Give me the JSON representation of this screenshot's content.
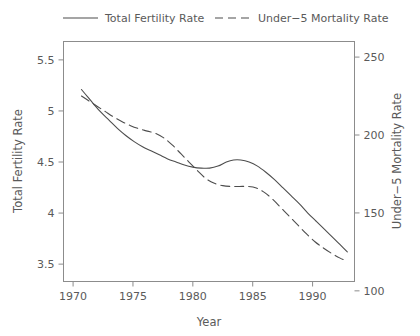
{
  "chart_data": {
    "type": "line",
    "title": "",
    "subtitle": "",
    "xlabel": "Year",
    "ylabel": "Total Fertility Rate",
    "y2label": "Under−5 Mortality Rate",
    "xlim": [
      1969.2,
      1993.5
    ],
    "ylim": [
      3.33,
      5.68
    ],
    "y2lim": [
      106,
      260
    ],
    "xticks": [
      1970,
      1975,
      1980,
      1985,
      1990
    ],
    "xticklabels": [
      "1970",
      "1975",
      "1980",
      "1985",
      "1990"
    ],
    "yticks": [
      3.5,
      4,
      4.5,
      5,
      5.5
    ],
    "yticklabels": [
      "3.5",
      "4",
      "4.5",
      "5",
      "5.5"
    ],
    "y2ticks": [
      100,
      150,
      200,
      250
    ],
    "y2ticklabels": [
      "100",
      "150",
      "200",
      "250"
    ],
    "grid": false,
    "legend_position": "top",
    "line_color": "#4d4d4d",
    "axis_color": "#808080",
    "series": [
      {
        "name": "Total Fertility Rate",
        "axis": "left",
        "style": "solid",
        "x": [
          1970.7,
          1971.2,
          1971.7,
          1972.3,
          1973.0,
          1973.7,
          1974.4,
          1975.1,
          1975.8,
          1976.5,
          1977.2,
          1977.9,
          1978.6,
          1979.3,
          1980.0,
          1980.7,
          1981.4,
          1982.1,
          1982.8,
          1983.4,
          1984.0,
          1984.7,
          1985.4,
          1986.1,
          1986.8,
          1987.5,
          1988.2,
          1988.9,
          1989.6,
          1990.3,
          1991.0,
          1991.7,
          1992.3,
          1992.9
        ],
        "y": [
          5.21,
          5.14,
          5.07,
          4.99,
          4.91,
          4.83,
          4.76,
          4.7,
          4.65,
          4.61,
          4.57,
          4.53,
          4.5,
          4.47,
          4.45,
          4.44,
          4.44,
          4.46,
          4.5,
          4.52,
          4.52,
          4.5,
          4.46,
          4.4,
          4.33,
          4.25,
          4.17,
          4.09,
          4.0,
          3.92,
          3.84,
          3.76,
          3.69,
          3.62
        ]
      },
      {
        "name": "Under−5 Mortality Rate",
        "axis": "right",
        "style": "dashed",
        "x": [
          1970.7,
          1971.3,
          1972.0,
          1972.7,
          1973.4,
          1974.1,
          1974.8,
          1975.5,
          1976.2,
          1976.9,
          1977.6,
          1978.3,
          1979.0,
          1979.7,
          1980.4,
          1981.1,
          1981.8,
          1982.5,
          1983.2,
          1983.9,
          1984.6,
          1985.3,
          1986.0,
          1986.7,
          1987.4,
          1988.1,
          1988.8,
          1989.5,
          1990.2,
          1990.9,
          1991.6,
          1992.3,
          1992.9
        ],
        "y": [
          225.0,
          222.0,
          218.5,
          215.0,
          211.5,
          208.5,
          206.0,
          204.0,
          202.5,
          201.0,
          198.0,
          193.5,
          188.0,
          182.5,
          177.0,
          172.0,
          169.0,
          167.5,
          167.0,
          167.0,
          167.0,
          166.0,
          163.0,
          158.5,
          153.0,
          147.5,
          142.0,
          136.5,
          131.5,
          127.5,
          124.0,
          121.0,
          119.0
        ]
      }
    ],
    "legend_entries": [
      {
        "label": "Total Fertility Rate",
        "style": "solid"
      },
      {
        "label": "Under−5 Mortality Rate",
        "style": "dashed"
      }
    ]
  }
}
